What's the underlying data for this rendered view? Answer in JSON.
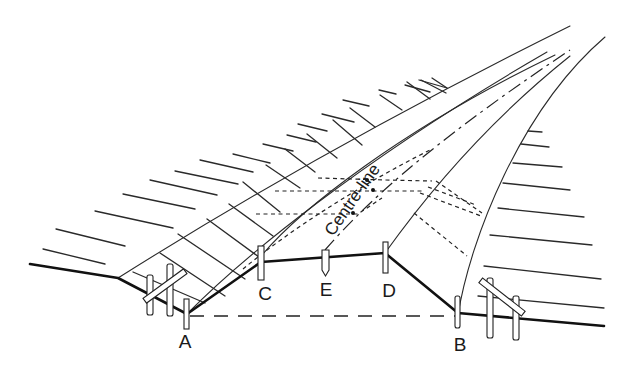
{
  "figure": {
    "type": "cross-section perspective of road cutting with setting-out pegs",
    "centre_line_label": "Centre-line",
    "point_labels": {
      "A": "A",
      "B": "B",
      "C": "C",
      "D": "D",
      "E": "E"
    },
    "colors": {
      "line": "#2a2a2a",
      "background": "#ffffff"
    }
  }
}
